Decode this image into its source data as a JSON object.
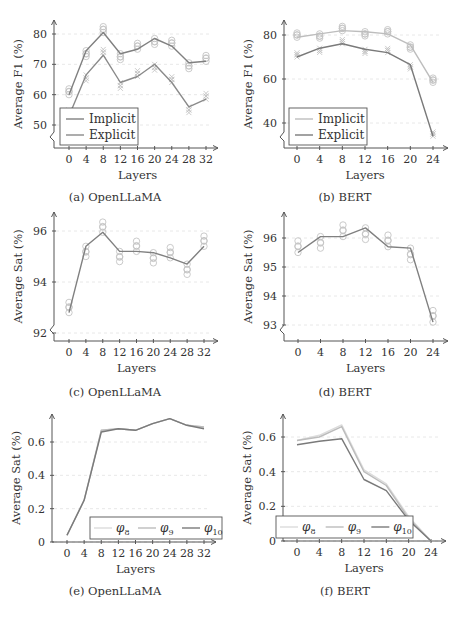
{
  "figure": {
    "palette": {
      "implicit_a": "#808080",
      "explicit_a": "#8a8a8a",
      "implicit_b": "#bdbdbd",
      "explicit_b": "#7a7a7a",
      "marker": "#c4c4c4",
      "phi8": "#dcdcdc",
      "phi9": "#bcbcbc",
      "phi10": "#7a7a7a"
    }
  },
  "chart_data": [
    {
      "id": "a",
      "type": "line",
      "caption": "(a) OpenLLaMA",
      "xlabel": "Layers",
      "ylabel": "Average F1 (%)",
      "x": [
        0,
        4,
        8,
        12,
        16,
        20,
        24,
        28,
        32
      ],
      "xticks": [
        "0",
        "4",
        "8",
        "12",
        "16",
        "20",
        "24",
        "28",
        "32"
      ],
      "yticks": [
        "50",
        "60",
        "70",
        "80"
      ],
      "ylim": [
        45,
        84
      ],
      "axis_break": true,
      "grid": true,
      "legend": [
        "Implicit",
        "Explicit"
      ],
      "legend_position": "lower left",
      "series": [
        {
          "name": "Implicit",
          "values": [
            60,
            74.5,
            80.5,
            73.5,
            75,
            78.5,
            76,
            70.5,
            71
          ],
          "marker": "circle"
        },
        {
          "name": "Explicit",
          "values": [
            53,
            66.5,
            73,
            64,
            66,
            70,
            64,
            56,
            58.5
          ],
          "marker": "x"
        }
      ]
    },
    {
      "id": "b",
      "type": "line",
      "caption": "(b) BERT",
      "xlabel": "Layers",
      "ylabel": "Average F1 (%)",
      "x": [
        0,
        4,
        8,
        12,
        16,
        20,
        24
      ],
      "xticks": [
        "0",
        "4",
        "8",
        "12",
        "16",
        "20",
        "24"
      ],
      "yticks": [
        "40",
        "60",
        "80"
      ],
      "ylim": [
        30,
        88
      ],
      "axis_break": true,
      "grid": true,
      "legend": [
        "Implicit",
        "Explicit"
      ],
      "legend_position": "lower left",
      "series": [
        {
          "name": "Implicit",
          "values": [
            79,
            80.5,
            82,
            81.5,
            80.5,
            75.5,
            58.5
          ],
          "marker": "circle"
        },
        {
          "name": "Explicit",
          "values": [
            70,
            74,
            76,
            73.5,
            72,
            66.5,
            34
          ],
          "marker": "x"
        }
      ]
    },
    {
      "id": "c",
      "type": "line",
      "caption": "(c) OpenLLaMA",
      "xlabel": "Layers",
      "ylabel": "Average Sat (%)",
      "x": [
        0,
        4,
        8,
        12,
        16,
        20,
        24,
        28,
        32
      ],
      "xticks": [
        "0",
        "4",
        "8",
        "12",
        "16",
        "20",
        "24",
        "28",
        "32"
      ],
      "yticks": [
        "92",
        "94",
        "96"
      ],
      "ylim": [
        91.8,
        96.6
      ],
      "axis_break": true,
      "grid": true,
      "series": [
        {
          "name": "Average",
          "values": [
            92.8,
            95.4,
            95.95,
            95.2,
            95.2,
            95.15,
            94.95,
            94.7,
            95.4
          ],
          "marker": "circle"
        }
      ]
    },
    {
      "id": "d",
      "type": "line",
      "caption": "(d) BERT",
      "xlabel": "Layers",
      "ylabel": "Average Sat (%)",
      "x": [
        0,
        4,
        8,
        12,
        16,
        20,
        24
      ],
      "xticks": [
        "0",
        "4",
        "8",
        "12",
        "16",
        "20",
        "24"
      ],
      "yticks": [
        "93",
        "94",
        "95",
        "96"
      ],
      "ylim": [
        92.5,
        96.7
      ],
      "axis_break": true,
      "grid": true,
      "series": [
        {
          "name": "Average",
          "values": [
            95.5,
            96.05,
            96.05,
            96.35,
            95.7,
            95.65,
            93.1
          ],
          "marker": "circle"
        }
      ]
    },
    {
      "id": "e",
      "type": "line",
      "caption": "(e) OpenLLaMA",
      "xlabel": "Layers",
      "ylabel": "Average Sat (%)",
      "x": [
        0,
        4,
        8,
        12,
        16,
        20,
        24,
        28,
        32
      ],
      "xticks": [
        "0",
        "4",
        "8",
        "12",
        "16",
        "20",
        "24",
        "28",
        "32"
      ],
      "yticks": [
        "0",
        "0.2",
        "0.4",
        "0.6"
      ],
      "ylim": [
        0,
        0.76
      ],
      "axis_break": false,
      "grid": true,
      "legend": [
        "φ8",
        "φ9",
        "φ10"
      ],
      "legend_position": "lower right",
      "series": [
        {
          "name": "φ8",
          "values": [
            0.04,
            0.25,
            0.67,
            0.68,
            0.67,
            0.71,
            0.74,
            0.7,
            0.69
          ]
        },
        {
          "name": "φ9",
          "values": [
            0.04,
            0.25,
            0.67,
            0.68,
            0.67,
            0.71,
            0.74,
            0.7,
            0.69
          ]
        },
        {
          "name": "φ10",
          "values": [
            0.04,
            0.25,
            0.66,
            0.68,
            0.67,
            0.71,
            0.74,
            0.7,
            0.68
          ]
        }
      ]
    },
    {
      "id": "f",
      "type": "line",
      "caption": "(f) BERT",
      "xlabel": "Layers",
      "ylabel": "Average Sat (%)",
      "x": [
        0,
        4,
        8,
        12,
        16,
        20,
        24
      ],
      "xticks": [
        "0",
        "4",
        "8",
        "12",
        "16",
        "20",
        "24"
      ],
      "yticks": [
        "0",
        "0.2",
        "0.4",
        "0.6"
      ],
      "ylim": [
        0,
        0.7
      ],
      "axis_break": false,
      "grid": true,
      "legend": [
        "φ8",
        "φ9",
        "φ10"
      ],
      "legend_position": "lower left",
      "series": [
        {
          "name": "φ8",
          "values": [
            0.58,
            0.61,
            0.67,
            0.41,
            0.33,
            0.14,
            0.0
          ]
        },
        {
          "name": "φ9",
          "values": [
            0.58,
            0.6,
            0.66,
            0.4,
            0.32,
            0.13,
            0.0
          ]
        },
        {
          "name": "φ10",
          "values": [
            0.555,
            0.575,
            0.59,
            0.355,
            0.29,
            0.12,
            0.0
          ]
        }
      ]
    }
  ]
}
